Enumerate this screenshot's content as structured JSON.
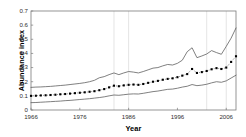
{
  "chart_data": {
    "type": "line",
    "title": "",
    "xlabel": "Year",
    "ylabel": "Abundance index",
    "xlim": [
      1966,
      2008
    ],
    "ylim": [
      0,
      0.7
    ],
    "yticks": [
      "0",
      "0.1",
      "0.2",
      "0.3",
      "0.4",
      "0.5",
      "0.6",
      "0.7"
    ],
    "ytick_values": [
      0,
      0.1,
      0.2,
      0.3,
      0.4,
      0.5,
      0.6,
      0.7
    ],
    "xticks": [
      "1966",
      "1976",
      "1986",
      "1996",
      "2006"
    ],
    "xtick_values": [
      1966,
      1976,
      1986,
      1996,
      2006
    ],
    "grid": "vertical-light",
    "gridlines_x": [
      1983,
      1986,
      2002,
      2006
    ],
    "legend": "none",
    "x": [
      1966,
      1967,
      1968,
      1969,
      1970,
      1971,
      1972,
      1973,
      1974,
      1975,
      1976,
      1977,
      1978,
      1979,
      1980,
      1981,
      1982,
      1983,
      1984,
      1985,
      1986,
      1987,
      1988,
      1989,
      1990,
      1991,
      1992,
      1993,
      1994,
      1995,
      1996,
      1997,
      1998,
      1999,
      2000,
      2001,
      2002,
      2003,
      2004,
      2005,
      2006,
      2007,
      2008
    ],
    "series": [
      {
        "name": "Abundance index",
        "style": "dotted-markers",
        "marker": "square",
        "color": "#000000",
        "values": [
          0.1,
          0.101,
          0.103,
          0.104,
          0.106,
          0.108,
          0.111,
          0.113,
          0.116,
          0.119,
          0.122,
          0.125,
          0.129,
          0.133,
          0.14,
          0.148,
          0.16,
          0.172,
          0.168,
          0.174,
          0.178,
          0.18,
          0.178,
          0.184,
          0.192,
          0.2,
          0.206,
          0.214,
          0.22,
          0.224,
          0.232,
          0.243,
          0.254,
          0.29,
          0.262,
          0.268,
          0.276,
          0.288,
          0.296,
          0.29,
          0.3,
          0.34,
          0.38
        ]
      },
      {
        "name": "Upper confidence bound",
        "style": "solid",
        "color": "#555555",
        "values": [
          0.16,
          0.162,
          0.163,
          0.165,
          0.167,
          0.17,
          0.173,
          0.176,
          0.18,
          0.184,
          0.188,
          0.193,
          0.2,
          0.21,
          0.228,
          0.236,
          0.25,
          0.262,
          0.25,
          0.262,
          0.272,
          0.268,
          0.262,
          0.272,
          0.284,
          0.296,
          0.3,
          0.312,
          0.322,
          0.318,
          0.33,
          0.352,
          0.412,
          0.44,
          0.37,
          0.382,
          0.396,
          0.42,
          0.406,
          0.394,
          0.45,
          0.508,
          0.58
        ]
      },
      {
        "name": "Lower confidence bound",
        "style": "solid",
        "color": "#555555",
        "values": [
          0.052,
          0.053,
          0.055,
          0.057,
          0.059,
          0.061,
          0.063,
          0.066,
          0.068,
          0.071,
          0.074,
          0.077,
          0.08,
          0.084,
          0.088,
          0.093,
          0.1,
          0.106,
          0.104,
          0.108,
          0.112,
          0.114,
          0.113,
          0.118,
          0.124,
          0.13,
          0.134,
          0.14,
          0.146,
          0.148,
          0.154,
          0.162,
          0.168,
          0.18,
          0.172,
          0.176,
          0.182,
          0.192,
          0.2,
          0.196,
          0.206,
          0.226,
          0.246
        ]
      }
    ]
  }
}
